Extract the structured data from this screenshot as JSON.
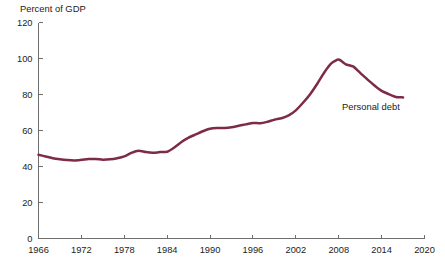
{
  "chart_data": {
    "type": "line",
    "title": "",
    "subtitle": "",
    "xlabel": "",
    "ylabel": "Percent of GDP",
    "xlim": [
      1966,
      2020
    ],
    "ylim": [
      0,
      120
    ],
    "grid": false,
    "legend_position": "inline-annotation",
    "y_ticks": [
      0,
      20,
      40,
      60,
      80,
      100,
      120
    ],
    "y_tick_labels": [
      "0",
      "20",
      "40",
      "60",
      "80",
      "100",
      "120"
    ],
    "x_ticks": [
      1966,
      1972,
      1978,
      1984,
      1990,
      1996,
      2002,
      2008,
      2014,
      2020
    ],
    "x_tick_labels": [
      "1966",
      "1972",
      "1978",
      "1984",
      "1990",
      "1996",
      "2002",
      "2008",
      "2014",
      "2020"
    ],
    "series": [
      {
        "name": "Personal debt",
        "color": "#7d2b46",
        "annotation": "Personal debt",
        "annotation_x": 2012.5,
        "annotation_y": 71.5,
        "x": [
          1966,
          1967,
          1968,
          1969,
          1970,
          1971,
          1972,
          1973,
          1974,
          1975,
          1976,
          1977,
          1978,
          1979,
          1980,
          1981,
          1982,
          1983,
          1984,
          1985,
          1986,
          1987,
          1988,
          1989,
          1990,
          1991,
          1992,
          1993,
          1994,
          1995,
          1996,
          1997,
          1998,
          1999,
          2000,
          2001,
          2002,
          2003,
          2004,
          2005,
          2006,
          2007,
          2008,
          2009,
          2010,
          2011,
          2012,
          2013,
          2014,
          2015,
          2016,
          2017
        ],
        "values": [
          46.5,
          45.6,
          44.6,
          44.0,
          43.6,
          43.4,
          43.7,
          44.1,
          44.2,
          43.8,
          44.0,
          44.6,
          45.6,
          47.6,
          48.8,
          48.0,
          47.6,
          48.0,
          48.2,
          50.6,
          53.6,
          56.0,
          57.8,
          59.6,
          61.0,
          61.4,
          61.4,
          61.8,
          62.6,
          63.4,
          64.2,
          64.0,
          64.8,
          66.0,
          66.8,
          68.4,
          71.2,
          75.4,
          80.2,
          86.0,
          92.4,
          97.4,
          99.4,
          96.8,
          95.6,
          92.0,
          88.4,
          85.0,
          82.0,
          80.2,
          78.6,
          78.4
        ]
      }
    ]
  },
  "axis": {
    "y_caption": "Percent of GDP"
  }
}
